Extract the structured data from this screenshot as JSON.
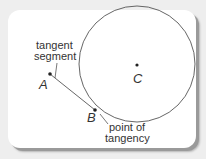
{
  "diagram": {
    "labels": {
      "tangent_segment_line1": "tangent",
      "tangent_segment_line2": "segment",
      "point_a": "A",
      "point_b": "B",
      "point_c": "C",
      "point_of_tangency_line1": "point of",
      "point_of_tangency_line2": "tangency"
    },
    "colors": {
      "stroke": "#555555",
      "background": "#ffffff",
      "frame_shadow": "#9a9a9a"
    }
  }
}
